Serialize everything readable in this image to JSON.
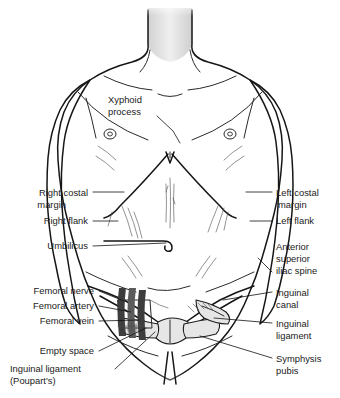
{
  "figure": {
    "colors": {
      "background": "#ffffff",
      "skin_light": "#ededed",
      "skin_mid": "#d9d9d9",
      "skin_shadow": "#bdbdbd",
      "outline": "#161616",
      "label_text": "#1a1a1a",
      "leader_line": "#111111",
      "bone_fill": "#e6e6e6",
      "vessel_dark": "#3d3d3d"
    }
  },
  "labels": {
    "left": [
      {
        "id": "xyphoid-process",
        "lines": [
          "Xyphoid",
          "process"
        ],
        "align": "start",
        "x": 108,
        "y": 103,
        "line_height": 12,
        "leader": "M 157 116 L 173 131 L 180 143"
      },
      {
        "id": "right-costal-margin",
        "lines": [
          "Right costal",
          "margin"
        ],
        "align": "end",
        "x": 88,
        "y": 196,
        "line_height": 12,
        "leader": "M 93 192 L 124 192"
      },
      {
        "id": "right-flank",
        "lines": [
          "Right flank"
        ],
        "align": "end",
        "x": 88,
        "y": 224,
        "line_height": 12,
        "leader": "M 93 221 L 118 221"
      },
      {
        "id": "umbilicus",
        "lines": [
          "Umbilicus"
        ],
        "align": "end",
        "x": 88,
        "y": 249,
        "line_height": 12,
        "leader": "M 93 246 L 166 243"
      },
      {
        "id": "femoral-nerve",
        "lines": [
          "Femoral nerve"
        ],
        "align": "end",
        "x": 94,
        "y": 294,
        "line_height": 12,
        "leader": "M 99 291 L 124 301"
      },
      {
        "id": "femoral-artery",
        "lines": [
          "Femoral artery"
        ],
        "align": "end",
        "x": 94,
        "y": 309,
        "line_height": 12,
        "leader": "M 99 306 L 131 312"
      },
      {
        "id": "femoral-vein",
        "lines": [
          "Femoral vein"
        ],
        "align": "end",
        "x": 94,
        "y": 324,
        "line_height": 12,
        "leader": "M 99 321 L 139 320"
      },
      {
        "id": "empty-space",
        "lines": [
          "Empty space"
        ],
        "align": "end",
        "x": 94,
        "y": 354,
        "line_height": 12,
        "leader": "M 99 351 L 146 328"
      },
      {
        "id": "inguinal-ligament-poupart",
        "lines": [
          "Inguinal ligament",
          "(Poupart's)"
        ],
        "align": "start",
        "x": 10,
        "y": 372,
        "line_height": 12,
        "leader": "M 115 369 L 155 332"
      }
    ],
    "right": [
      {
        "id": "left-costal-margin",
        "lines": [
          "Left costal",
          "margin"
        ],
        "align": "start",
        "x": 276,
        "y": 196,
        "line_height": 12,
        "leader": "M 272 192 L 246 192"
      },
      {
        "id": "left-flank",
        "lines": [
          "Left flank"
        ],
        "align": "start",
        "x": 276,
        "y": 224,
        "line_height": 12,
        "leader": "M 272 221 L 250 221"
      },
      {
        "id": "anterior-superior-iliac-spine",
        "lines": [
          "Anterior",
          "superior",
          "iliac spine"
        ],
        "align": "start",
        "x": 276,
        "y": 250,
        "line_height": 12,
        "leader": "M 272 272 L 258 258"
      },
      {
        "id": "inguinal-canal",
        "lines": [
          "Inguinal",
          "canal"
        ],
        "align": "start",
        "x": 276,
        "y": 296,
        "line_height": 12,
        "leader": "M 272 292 L 223 300"
      },
      {
        "id": "inguinal-ligament",
        "lines": [
          "Inguinal",
          "ligament"
        ],
        "align": "start",
        "x": 276,
        "y": 327,
        "line_height": 12,
        "leader": "M 272 323 L 214 318"
      },
      {
        "id": "symphysis-pubis",
        "lines": [
          "Symphysis",
          "pubis"
        ],
        "align": "start",
        "x": 276,
        "y": 362,
        "line_height": 12,
        "leader": "M 272 358 L 200 336"
      }
    ]
  },
  "anatomy": {
    "parts": [
      "neck",
      "clavicle-left",
      "clavicle-right",
      "shoulder-left",
      "shoulder-right",
      "arm-left",
      "arm-right",
      "nipple-left",
      "nipple-right",
      "sternum",
      "costal-margin-left",
      "costal-margin-right",
      "linea-alba",
      "umbilicus",
      "iliac-crest-left",
      "iliac-crest-right",
      "inguinal-ligament-left",
      "inguinal-ligament-right",
      "pubic-symphysis",
      "femoral-vessels",
      "pelvis-bone",
      "inguinal-canal"
    ]
  }
}
